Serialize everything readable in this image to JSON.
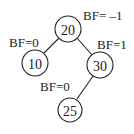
{
  "diagram": {
    "type": "binary-search-tree",
    "nodes": [
      {
        "id": "n20",
        "value": "20",
        "bf_label": "BF= –1",
        "cx": 68,
        "cy": 29,
        "r": 13,
        "bf_x": 83,
        "bf_y": 20
      },
      {
        "id": "n10",
        "value": "10",
        "bf_label": "BF=0",
        "cx": 35,
        "cy": 63,
        "r": 13,
        "bf_x": 9,
        "bf_y": 47
      },
      {
        "id": "n30",
        "value": "30",
        "bf_label": "BF=1",
        "cx": 100,
        "cy": 65,
        "r": 13,
        "bf_x": 97,
        "bf_y": 49
      },
      {
        "id": "n25",
        "value": "25",
        "bf_label": "BF=0",
        "cx": 70,
        "cy": 110,
        "r": 12,
        "bf_x": 40,
        "bf_y": 91
      }
    ],
    "edges": [
      {
        "from": "20",
        "to": "10"
      },
      {
        "from": "20",
        "to": "30"
      },
      {
        "from": "30",
        "to": "25"
      }
    ]
  }
}
